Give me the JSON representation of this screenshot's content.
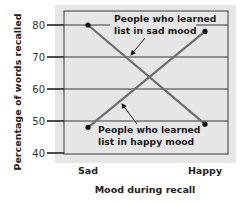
{
  "chart_data": {
    "type": "line",
    "title": "",
    "xlabel": "Mood during recall",
    "ylabel": "Percentage of words recalled",
    "categories": [
      "Sad",
      "Happy"
    ],
    "ylim": [
      40,
      80
    ],
    "yticks": [
      40,
      50,
      60,
      70,
      80
    ],
    "grid": true,
    "series": [
      {
        "name": "People who learned list in sad mood",
        "label_lines": [
          "People who learned",
          "list in sad mood"
        ],
        "values": [
          80,
          49
        ],
        "color": "#6e6e6e"
      },
      {
        "name": "People who learned list in happy mood",
        "label_lines": [
          "People who learned",
          "list in happy mood"
        ],
        "values": [
          48,
          78
        ],
        "color": "#6e6e6e"
      }
    ],
    "colors": {
      "panel_bg": "#e6e6e6",
      "frame": "#3a3a3a",
      "grid": "#3a3a3a",
      "point": "#111111"
    }
  }
}
